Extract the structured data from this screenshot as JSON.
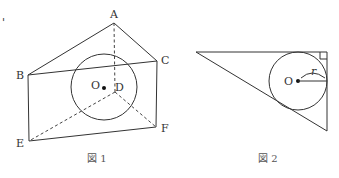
{
  "figure1": {
    "caption": "図 1",
    "labels": {
      "A": "A",
      "B": "B",
      "C": "C",
      "D": "D",
      "E": "E",
      "F": "F",
      "O": "O"
    },
    "stray_mark": "'"
  },
  "figure2": {
    "caption": "図 2",
    "labels": {
      "O": "O",
      "r": "r"
    }
  },
  "colors": {
    "line": "#333333",
    "text": "#333333",
    "background": "#ffffff"
  }
}
